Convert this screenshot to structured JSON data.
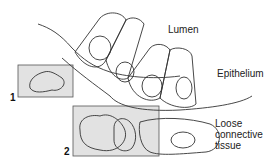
{
  "diagram": {
    "labels": {
      "lumen": "Lumen",
      "epithelium": "Epithelium",
      "connective_line1": "Loose",
      "connective_line2": "connective",
      "connective_line3": "tissue"
    },
    "boxes": [
      {
        "id": "1",
        "label": "1"
      },
      {
        "id": "2",
        "label": "2"
      }
    ],
    "colors": {
      "box_fill": "#e2e2e2",
      "stroke": "#333333",
      "background": "#ffffff"
    }
  }
}
